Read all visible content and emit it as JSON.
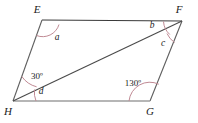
{
  "figure": {
    "type": "parallelogram-with-diagonal",
    "stroke_colors": {
      "side_top": "#3a3a3a",
      "side_left": "#5a5a5a",
      "side_right": "#5a5a5a",
      "side_bottom": "#9a9a9a",
      "diagonal": "#4a4a4a",
      "arc": "#c08a94"
    },
    "vertices": [
      {
        "name": "E",
        "label": "E",
        "x": 42,
        "y": 20,
        "label_x": 37,
        "label_y": 13
      },
      {
        "name": "F",
        "label": "F",
        "x": 182,
        "y": 21,
        "label_x": 178,
        "label_y": 13
      },
      {
        "name": "G",
        "label": "G",
        "x": 150,
        "y": 101,
        "label_x": 147,
        "label_y": 114
      },
      {
        "name": "H",
        "label": "H",
        "x": 13,
        "y": 101,
        "label_x": 6,
        "label_y": 114
      }
    ],
    "edges": [
      {
        "name": "edge-EF",
        "from": "E",
        "to": "F"
      },
      {
        "name": "edge-FG",
        "from": "F",
        "to": "G"
      },
      {
        "name": "edge-GH",
        "from": "G",
        "to": "H"
      },
      {
        "name": "edge-HE",
        "from": "H",
        "to": "E"
      }
    ],
    "diagonal": {
      "name": "diagonal-HF",
      "from": "H",
      "to": "F"
    },
    "angles": [
      {
        "name": "angle-a-at-E",
        "label": "a",
        "vertex": "E",
        "label_x": 57,
        "label_y": 39,
        "arc": "M 36.5 35.5 A 17 17 0 0 0 59 24.5"
      },
      {
        "name": "angle-b-at-F",
        "label": "b",
        "vertex": "F",
        "label_x": 151,
        "label_y": 28,
        "arc": "M 164 22 A 19 19 0 0 0 169.5 34"
      },
      {
        "name": "angle-c-at-F",
        "label": "c",
        "vertex": "F",
        "label_x": 161,
        "label_y": 45,
        "arc": "M 168.5 35.5 A 20 20 0 0 0 174 41.5"
      },
      {
        "name": "angle-30-at-H",
        "label": "30º",
        "vertex": "H",
        "label_x": 26,
        "label_y": 79,
        "arc": "M 22 76 A 26 26 0 0 0 36.5 86.5"
      },
      {
        "name": "angle-d-at-H",
        "label": "d",
        "vertex": "H",
        "label_x": 38,
        "label_y": 93,
        "arc": "M 36.5 87 A 26 26 0 0 0 39 101"
      },
      {
        "name": "angle-130-at-G",
        "label": "130º",
        "vertex": "G",
        "label_x": 121,
        "label_y": 86,
        "arc": "M 129 101 A 21 21 0 0 1 158.5 84"
      }
    ]
  }
}
